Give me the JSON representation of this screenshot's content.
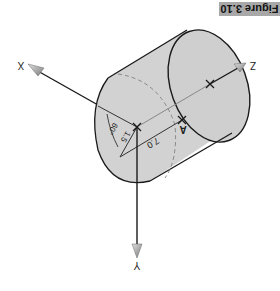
{
  "figure": {
    "caption": "Figure 3.10",
    "orientation": "rotated 180 degrees",
    "axes": {
      "x": "X",
      "y": "Y",
      "z": "Z"
    },
    "point_label": "A",
    "dimensions": {
      "length": "7.0",
      "radius": "1.5",
      "angle": "60°"
    },
    "colors": {
      "cylinder_fill": "#d2d2d2",
      "outline": "#1a1a1a",
      "arrow_fill": "#9a9a9a",
      "caption_bg": "#a8a8a8"
    }
  }
}
